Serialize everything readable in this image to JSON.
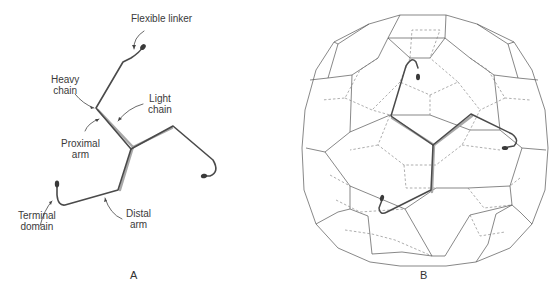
{
  "panels": [
    {
      "id": "A",
      "letter": "A",
      "title": "Clathrin triskelion",
      "labels": {
        "flexible_linker": "Flexible linker",
        "heavy_chain_l1": "Heavy",
        "heavy_chain_l2": "chain",
        "light_chain_l1": "Light",
        "light_chain_l2": "chain",
        "proximal_arm_l1": "Proximal",
        "proximal_arm_l2": "arm",
        "terminal_domain_l1": "Terminal",
        "terminal_domain_l2": "domain",
        "distal_arm_l1": "Distal",
        "distal_arm_l2": "arm"
      }
    },
    {
      "id": "B",
      "letter": "B",
      "title": "Clathrin lattice (polyhedral cage) with one triskelion highlighted"
    }
  ],
  "colors": {
    "heavy_chain": "#4a4a4a",
    "light_chain": "#a8a8a8",
    "cage_line": "#555555",
    "text": "#3a3a3a"
  }
}
